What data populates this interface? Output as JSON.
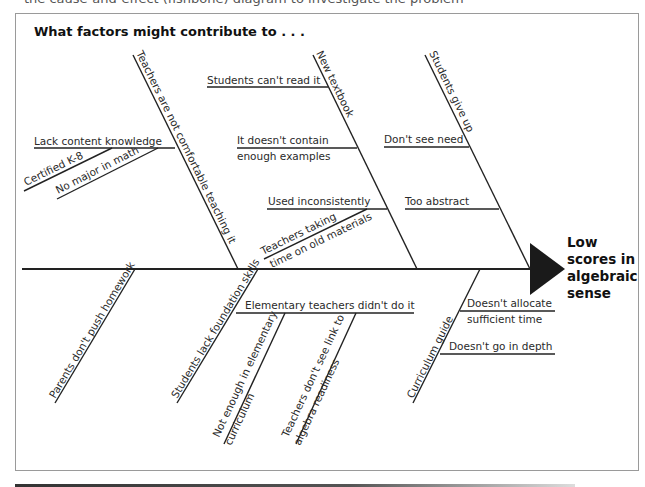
{
  "page": {
    "top_cut_text": "the cause-and-effect (fishbone) diagram to investigate the problem",
    "title": "What factors might contribute to . . ."
  },
  "effect": {
    "lines": [
      "Low",
      "scores in",
      "algebraic",
      "sense"
    ],
    "arrow_color": "#1a1a1a"
  },
  "upper_bones": [
    {
      "label": "Teachers are not comfortable teaching it",
      "causes": [
        {
          "label": "Lack content knowledge"
        },
        {
          "label": "Certified K-8"
        },
        {
          "label": "No major in math"
        }
      ]
    },
    {
      "label": "New textbook",
      "causes": [
        {
          "label": "Students can't read it"
        },
        {
          "line1": "It doesn't contain",
          "line2": "enough examples"
        },
        {
          "label": "Used inconsistently"
        },
        {
          "line1": "Teachers taking",
          "line2": "time on old materials"
        }
      ]
    },
    {
      "label": "Students give up",
      "causes": [
        {
          "label": "Don't see need"
        },
        {
          "label": "Too abstract"
        }
      ]
    }
  ],
  "lower_bones": [
    {
      "label": "Parents don't push homework",
      "causes": []
    },
    {
      "label": "Students lack foundation skills",
      "causes": [
        {
          "label": "Elementary teachers didn't do it"
        },
        {
          "line1": "Not enough in elementary",
          "line2": "curriculum"
        },
        {
          "line1": "Teachers don't see link to",
          "line2": "algebra readiness"
        }
      ]
    },
    {
      "label": "Curriculum guide",
      "causes": [
        {
          "line1": "Doesn't allocate",
          "line2": "sufficient time"
        },
        {
          "label": "Doesn't go in depth"
        }
      ]
    }
  ]
}
